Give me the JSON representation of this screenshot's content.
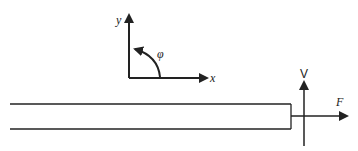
{
  "diagram": {
    "type": "beam free-body diagram",
    "coordinate_system": {
      "x_label": "x",
      "y_label": "y",
      "angle_label": "φ"
    },
    "beam": {
      "end_forces": {
        "vertical_label": "V",
        "horizontal_label": "F"
      }
    },
    "colors": {
      "line": "#222222",
      "background": "#ffffff"
    }
  }
}
